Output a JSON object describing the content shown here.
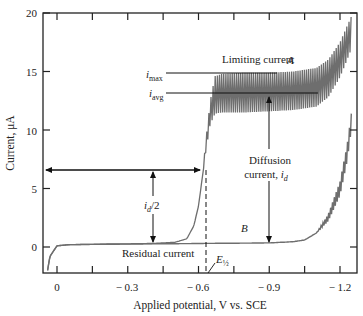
{
  "chart_data": {
    "type": "line",
    "title": "",
    "xlabel": "Applied potential, V vs. SCE",
    "ylabel": "Current, μA",
    "xlim": [
      0.05,
      -1.27
    ],
    "ylim": [
      -2.2,
      20
    ],
    "x_ticks": [
      0,
      -0.3,
      -0.6,
      -0.9,
      -1.2
    ],
    "x_tick_labels": [
      "0",
      "− 0.3",
      "− 0.6",
      "− 0.9",
      "− 1.2"
    ],
    "x_minor_ticks": [
      -0.15,
      -0.45,
      -0.75,
      -1.05
    ],
    "y_ticks": [
      0,
      5,
      10,
      15,
      20
    ],
    "y_tick_labels": [
      "0",
      "5",
      "10",
      "15",
      "20"
    ],
    "grid": false,
    "legend": null,
    "series": [
      {
        "name": "A",
        "description": "Polarogram with analyte (oscillating DME current)",
        "x": [
          0.04,
          0.03,
          0.0,
          -0.05,
          -0.2,
          -0.4,
          -0.5,
          -0.55,
          -0.58,
          -0.6,
          -0.62,
          -0.63,
          -0.65,
          -0.67,
          -0.7,
          -0.8,
          -0.9,
          -1.0,
          -1.1,
          -1.15,
          -1.2,
          -1.25
        ],
        "y_max": [
          -2.0,
          -0.8,
          0.1,
          0.2,
          0.25,
          0.3,
          0.4,
          0.7,
          1.8,
          3.5,
          6.5,
          9.0,
          12.5,
          14.6,
          14.8,
          14.9,
          14.9,
          15.0,
          15.3,
          16.0,
          17.5,
          19.8
        ],
        "y_min": [
          -2.0,
          -0.8,
          0.1,
          0.2,
          0.25,
          0.3,
          0.4,
          0.7,
          1.8,
          3.5,
          6.5,
          8.0,
          10.5,
          11.4,
          11.5,
          11.5,
          11.6,
          11.7,
          12.0,
          12.8,
          14.5,
          17.0
        ]
      },
      {
        "name": "B",
        "description": "Residual current (supporting electrolyte only)",
        "x": [
          0.04,
          0.03,
          0.0,
          -0.05,
          -0.3,
          -0.6,
          -0.9,
          -1.0,
          -1.05,
          -1.1,
          -1.15,
          -1.2,
          -1.23,
          -1.25
        ],
        "y": [
          -2.0,
          -0.8,
          0.1,
          0.2,
          0.25,
          0.3,
          0.35,
          0.45,
          0.6,
          1.2,
          2.5,
          5.0,
          8.0,
          11.0
        ]
      }
    ],
    "annotations": [
      {
        "text": "Limiting current",
        "x": -0.66,
        "y": 16.3
      },
      {
        "text": "A",
        "x": -0.87,
        "y": 16.0,
        "italic": true
      },
      {
        "text": "B",
        "x": -0.78,
        "y": 1.3,
        "italic": true
      },
      {
        "text": "i_max",
        "x": -0.25,
        "y": 14.7,
        "line_to_x": -0.85
      },
      {
        "text": "i_avg",
        "x": -0.25,
        "y": 13.2,
        "line_to_x": -1.12
      },
      {
        "text": "Diffusion current, i_d",
        "x": -0.9,
        "y": 6.5,
        "arrow": "double vertical from 0.35 to 13.2 at x=-0.9"
      },
      {
        "text": "i_d/2",
        "x": -0.4,
        "y": 3.3,
        "arrow": "double vertical from 0.35 to 6.6 at x=-0.4"
      },
      {
        "text": "Residual current",
        "x": -0.3,
        "y": -0.5
      },
      {
        "text": "E½",
        "x": -0.67,
        "y": -1.2,
        "italic": true,
        "dashed_line_x": -0.625
      },
      {
        "text": "horizontal arrow at half-wave current",
        "y": 6.7,
        "x_from": 0.05,
        "x_to": -0.625
      }
    ]
  },
  "labels": {
    "x_axis_title": "Applied potential, V vs. SCE",
    "y_axis_title": "Current, μA",
    "limiting_current": "Limiting current",
    "curve_a": "A",
    "curve_b": "B",
    "i_max_main": "i",
    "i_max_sub": "max",
    "i_avg_main": "i",
    "i_avg_sub": "avg",
    "diffusion_line1": "Diffusion",
    "diffusion_line2": "current, ",
    "diffusion_i": "i",
    "diffusion_sub": "d",
    "half_i": "i",
    "half_sub": "d",
    "half_rest": "/2",
    "residual_current": "Residual current",
    "e_half_main": "E",
    "e_half_sub": "½",
    "x_ticks": [
      "0",
      "− 0.3",
      "− 0.6",
      "− 0.9",
      "− 1.2"
    ],
    "y_ticks": [
      "0",
      "5",
      "10",
      "15",
      "20"
    ]
  },
  "colors": {
    "axis": "#222222",
    "curve": "#6e6e6e",
    "annotation": "#111111"
  }
}
